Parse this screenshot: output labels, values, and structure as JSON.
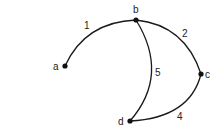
{
  "diagram": {
    "type": "graph",
    "nodes": [
      {
        "id": "a",
        "label": "a",
        "x": 65,
        "y": 66
      },
      {
        "id": "b",
        "label": "b",
        "x": 136,
        "y": 20
      },
      {
        "id": "c",
        "label": "c",
        "x": 201,
        "y": 74
      },
      {
        "id": "d",
        "label": "d",
        "x": 130,
        "y": 121
      }
    ],
    "edges": [
      {
        "from": "a",
        "to": "b",
        "label": "1"
      },
      {
        "from": "b",
        "to": "c",
        "label": "2"
      },
      {
        "from": "b",
        "to": "d",
        "label": "5"
      },
      {
        "from": "c",
        "to": "d",
        "label": "4"
      }
    ]
  }
}
